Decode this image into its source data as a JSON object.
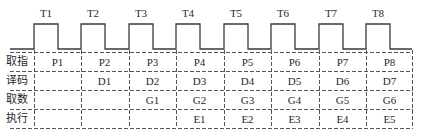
{
  "diagram": {
    "type": "instruction-pipeline-timing",
    "clock_labels": [
      "T1",
      "T2",
      "T3",
      "T4",
      "T5",
      "T6",
      "T7",
      "T8"
    ],
    "stages": [
      {
        "label": "取指",
        "cells": [
          "P1",
          "P2",
          "P3",
          "P4",
          "P5",
          "P6",
          "P7",
          "P8"
        ]
      },
      {
        "label": "译码",
        "cells": [
          "",
          "D1",
          "D2",
          "D3",
          "D4",
          "D5",
          "D6",
          "D7"
        ]
      },
      {
        "label": "取数",
        "cells": [
          "",
          "",
          "G1",
          "G2",
          "G3",
          "G4",
          "G5",
          "G6"
        ]
      },
      {
        "label": "执行",
        "cells": [
          "",
          "",
          "",
          "E1",
          "E2",
          "E3",
          "E4",
          "E5"
        ]
      }
    ],
    "colors": {
      "line": "#3a3a3a",
      "dash": "#555555",
      "text": "#2a2a2a"
    }
  }
}
